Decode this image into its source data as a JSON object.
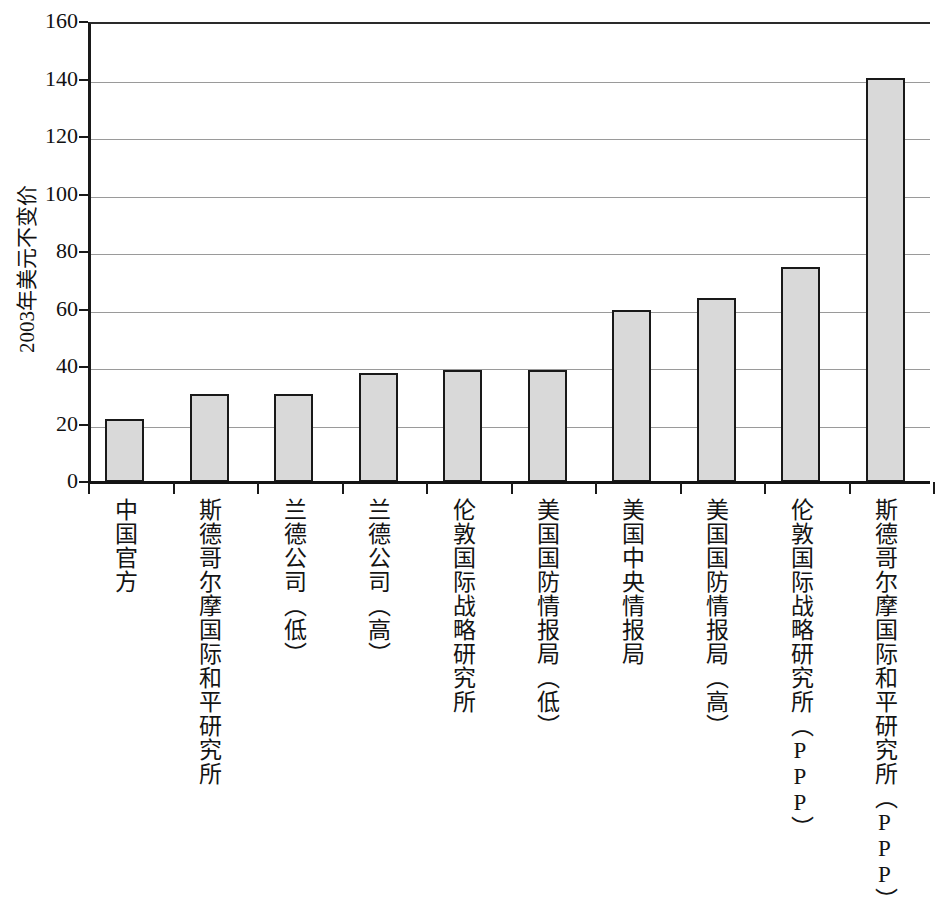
{
  "chart_data": {
    "type": "bar",
    "title": "",
    "subtitle": "",
    "xlabel": "",
    "ylabel": "2003年美元不变价",
    "ylim": [
      0,
      160
    ],
    "ytick_values": [
      160,
      140,
      120,
      100,
      80,
      60,
      40,
      20,
      0
    ],
    "ytick_labels": [
      "160",
      "140",
      "120",
      "100",
      "80",
      "60",
      "40",
      "20",
      "0"
    ],
    "grid": "horizontal",
    "legend": "none",
    "orientation": "vertical",
    "bar_fill_color": "#d9d9d9",
    "bar_border_color": "#191919",
    "gridline_color": "#9a9a9a",
    "axis_color": "#141414",
    "categories": [
      "中国官方",
      "斯德哥尔摩国际和平研究所",
      "兰德公司（低）",
      "兰德公司（高）",
      "伦敦国际战略研究所",
      "美国国防情报局（低）",
      "美国中央情报局",
      "美国国防情报局（高）",
      "伦敦国际战略研究所（PPP）",
      "斯德哥尔摩国际和平研究所（PPP）"
    ],
    "values": [
      22,
      30.5,
      30.5,
      37.8,
      39,
      39,
      60,
      64,
      74.8,
      140.5
    ],
    "series": [
      {
        "name": "",
        "values": [
          22,
          30.5,
          30.5,
          37.8,
          39,
          39,
          60,
          64,
          74.8,
          140.5
        ]
      }
    ]
  },
  "axis": {
    "y_title": "2003年美元不变价"
  }
}
